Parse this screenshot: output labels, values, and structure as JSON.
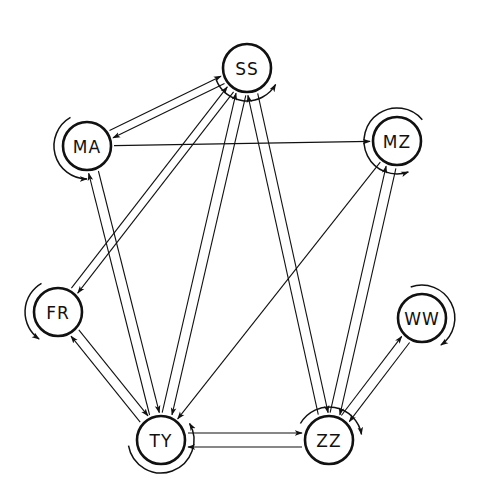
{
  "diagram": {
    "type": "directed-graph",
    "nodes": [
      {
        "id": "SS",
        "label": "SS",
        "x": 247,
        "y": 68,
        "loop": {
          "start": 200,
          "end": 330,
          "dir": "ccw"
        }
      },
      {
        "id": "MA",
        "label": "MA",
        "x": 87,
        "y": 146,
        "loop": {
          "start": 120,
          "end": 270,
          "dir": "ccw"
        }
      },
      {
        "id": "MZ",
        "label": "MZ",
        "x": 397,
        "y": 141,
        "loop": {
          "start": 40,
          "end": 290,
          "dir": "ccw"
        }
      },
      {
        "id": "FR",
        "label": "FR",
        "x": 58,
        "y": 312,
        "loop": {
          "start": 120,
          "end": 235,
          "dir": "ccw"
        }
      },
      {
        "id": "WW",
        "label": "WW",
        "x": 422,
        "y": 318,
        "loop": {
          "start": 110,
          "end": 305,
          "dir": "cw"
        }
      },
      {
        "id": "TY",
        "label": "TY",
        "x": 161,
        "y": 440,
        "loop": {
          "start": 190,
          "end": 30,
          "dir": "ccw"
        }
      },
      {
        "id": "ZZ",
        "label": "ZZ",
        "x": 329,
        "y": 440,
        "loop": {
          "start": 150,
          "end": 10,
          "dir": "cw"
        }
      }
    ],
    "edges": [
      {
        "from": "SS",
        "to": "MA",
        "offset": -4
      },
      {
        "from": "MA",
        "to": "SS",
        "offset": -4
      },
      {
        "from": "MA",
        "to": "MZ",
        "offset": 0
      },
      {
        "from": "SS",
        "to": "FR",
        "offset": -4
      },
      {
        "from": "FR",
        "to": "SS",
        "offset": -4
      },
      {
        "from": "MA",
        "to": "TY",
        "offset": -5
      },
      {
        "from": "TY",
        "to": "MA",
        "offset": -5
      },
      {
        "from": "SS",
        "to": "TY",
        "offset": -5
      },
      {
        "from": "TY",
        "to": "SS",
        "offset": -5
      },
      {
        "from": "MZ",
        "to": "TY",
        "offset": 0
      },
      {
        "from": "SS",
        "to": "ZZ",
        "offset": -5
      },
      {
        "from": "ZZ",
        "to": "SS",
        "offset": -5
      },
      {
        "from": "MZ",
        "to": "ZZ",
        "offset": -5
      },
      {
        "from": "ZZ",
        "to": "MZ",
        "offset": -5
      },
      {
        "from": "WW",
        "to": "ZZ",
        "offset": -5
      },
      {
        "from": "ZZ",
        "to": "WW",
        "offset": -5
      },
      {
        "from": "FR",
        "to": "TY",
        "offset": -5
      },
      {
        "from": "TY",
        "to": "FR",
        "offset": -5
      },
      {
        "from": "TY",
        "to": "ZZ",
        "offset": -7
      },
      {
        "from": "ZZ",
        "to": "TY",
        "offset": -7
      }
    ],
    "style": {
      "node_radius": 24,
      "stroke_color": "#111111",
      "background": "#ffffff"
    }
  }
}
